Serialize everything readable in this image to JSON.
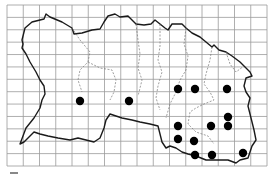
{
  "map": {
    "type": "distribution-map",
    "grid": {
      "left": 7,
      "top": 5,
      "right": 267,
      "bottom": 166,
      "columns": 16,
      "rows": 13,
      "color": "#9a9a9a"
    },
    "colors": {
      "coast": "#1a1a1a",
      "parish": "#777777",
      "dot": "#000000",
      "background": "#ffffff"
    },
    "records": [
      {
        "x": 80,
        "y": 101
      },
      {
        "x": 129,
        "y": 101
      },
      {
        "x": 178,
        "y": 89
      },
      {
        "x": 195,
        "y": 89
      },
      {
        "x": 227,
        "y": 89
      },
      {
        "x": 228,
        "y": 117
      },
      {
        "x": 178,
        "y": 126
      },
      {
        "x": 211,
        "y": 126
      },
      {
        "x": 228,
        "y": 126
      },
      {
        "x": 178,
        "y": 139
      },
      {
        "x": 194,
        "y": 141
      },
      {
        "x": 195,
        "y": 155
      },
      {
        "x": 212,
        "y": 155
      },
      {
        "x": 243,
        "y": 153
      }
    ],
    "record_count": 14
  }
}
